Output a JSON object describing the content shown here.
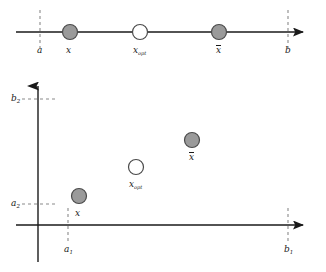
{
  "figure": {
    "width": 326,
    "height": 272,
    "background": "#ffffff",
    "ink": "#1a1a1a"
  },
  "markers": {
    "filled_fill": "#9a9a9a",
    "filled_stroke": "#4a4a4a",
    "open_fill": "#ffffff",
    "open_stroke": "#4a4a4a",
    "radius": 7.5
  },
  "panel_top": {
    "name": "one-dimensional-interval",
    "axis": {
      "y": 32,
      "x_start": 16,
      "x_end": 312,
      "arrow": "right"
    },
    "bounds": [
      {
        "id": "a",
        "label": "a",
        "x": 40,
        "dash_top": 10,
        "dash_bottom": 48
      },
      {
        "id": "b",
        "label": "b",
        "x": 288,
        "dash_top": 10,
        "dash_bottom": 48
      }
    ],
    "points": [
      {
        "id": "x-lower",
        "label": "x",
        "label_overline": false,
        "x": 70,
        "style": "filled"
      },
      {
        "id": "x-opt",
        "label": "x",
        "label_sub": "opt",
        "label_overline": false,
        "x": 140,
        "style": "open"
      },
      {
        "id": "x-bar",
        "label": "x",
        "label_overline": true,
        "x": 219,
        "style": "filled"
      }
    ]
  },
  "panel_bottom": {
    "name": "two-dimensional-box",
    "x_axis": {
      "y": 225,
      "x_start": 16,
      "x_end": 312,
      "arrow": "right"
    },
    "y_axis": {
      "x": 38,
      "y_start": 262,
      "y_end": 78,
      "arrow": "up"
    },
    "y_ticks": [
      {
        "id": "b2",
        "label": "b",
        "sub": "2",
        "y": 99,
        "dash_x_start": 22,
        "dash_x_end": 57
      },
      {
        "id": "a2",
        "label": "a",
        "sub": "2",
        "y": 204,
        "dash_x_start": 22,
        "dash_x_end": 57
      }
    ],
    "x_ticks": [
      {
        "id": "a1",
        "label": "a",
        "sub": "1",
        "x": 68,
        "dash_y_start": 208,
        "dash_y_end": 244
      },
      {
        "id": "b1",
        "label": "b",
        "sub": "1",
        "x": 288,
        "dash_y_start": 208,
        "dash_y_end": 244
      }
    ],
    "points": [
      {
        "id": "x-lower",
        "label": "x",
        "label_overline": false,
        "x": 79,
        "y": 196,
        "style": "filled"
      },
      {
        "id": "x-opt",
        "label": "x",
        "label_sub": "opt",
        "label_overline": false,
        "x": 136,
        "y": 167,
        "style": "open"
      },
      {
        "id": "x-bar",
        "label": "x",
        "label_overline": true,
        "x": 192,
        "y": 140,
        "style": "filled"
      }
    ]
  }
}
